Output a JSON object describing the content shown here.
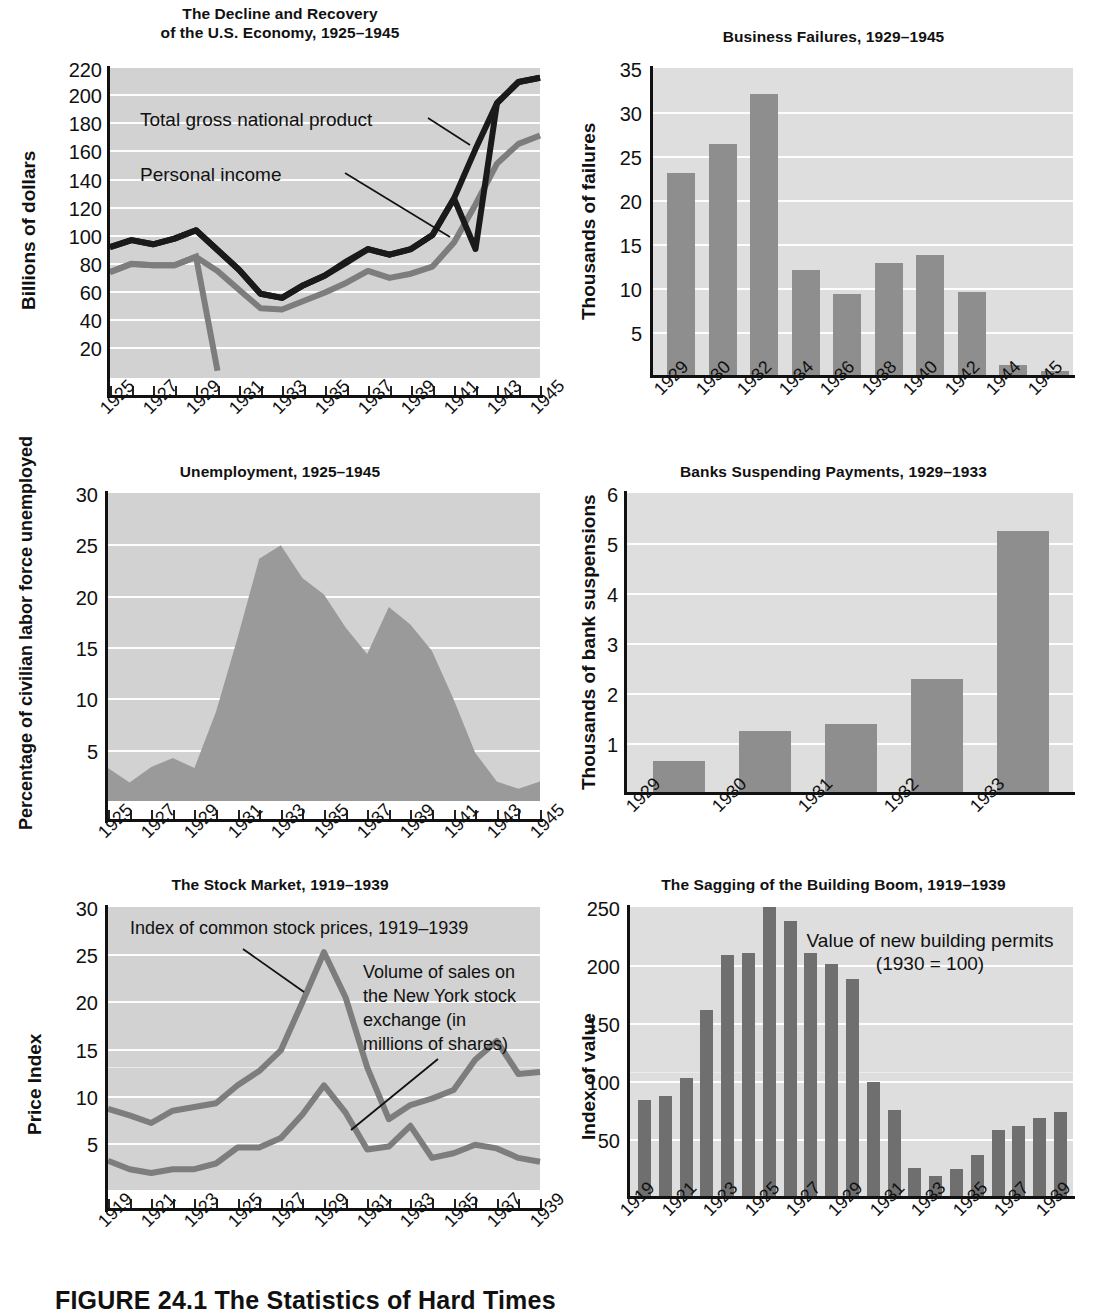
{
  "figure": {
    "caption": "FIGURE 24.1  The Statistics of Hard Times"
  },
  "charts": [
    {
      "id": "gnp",
      "title_line1": "The Decline and Recovery",
      "title_line2": "of the U.S. Economy, 1925–1945",
      "ylabel": "Billions of dollars",
      "yticks": [
        "220",
        "200",
        "180",
        "160",
        "140",
        "120",
        "100",
        "80",
        "60",
        "40",
        "20"
      ],
      "xticks": [
        "1925",
        "1927",
        "1929",
        "1931",
        "1933",
        "1935",
        "1937",
        "1939",
        "1941",
        "1943",
        "1945"
      ],
      "annotations": [
        "Total gross national product",
        "Personal income"
      ],
      "chart_data": {
        "type": "line",
        "title": "The Decline and Recovery of the U.S. Economy, 1925–1945",
        "xlabel": "",
        "ylabel": "Billions of dollars",
        "ylim": [
          0,
          220
        ],
        "grid": true,
        "legend": "inline-annotation",
        "x": [
          1925,
          1926,
          1927,
          1928,
          1929,
          1930,
          1931,
          1932,
          1933,
          1934,
          1935,
          1936,
          1937,
          1938,
          1939,
          1940,
          1941,
          1942,
          1943,
          1944,
          1945
        ],
        "series": [
          {
            "name": "Total gross national product",
            "color": "#1a1a1a",
            "values": [
              93,
              98,
              95,
              99,
              105,
              91,
              77,
              60,
              57,
              66,
              73,
              83,
              91,
              87,
              91,
              101,
              127,
              162,
              195,
              210,
              213
            ]
          },
          {
            "name": "Personal income",
            "color": "#7d7d7d",
            "values": [
              75,
              81,
              80,
              80,
              86,
              76,
              63,
              50,
              49,
              55,
              61,
              68,
              76,
              71,
              74,
              79,
              96,
              123,
              152,
              166,
              172
            ]
          }
        ]
      }
    },
    {
      "id": "business-failures",
      "title_line1": "Business Failures, 1929–1945",
      "title_line2": "",
      "ylabel": "Thousands of failures",
      "yticks": [
        "35",
        "30",
        "25",
        "20",
        "15",
        "10",
        "5"
      ],
      "xticks": [
        "1929",
        "1930",
        "1932",
        "1934",
        "1936",
        "1938",
        "1940",
        "1942",
        "1944",
        "1945"
      ],
      "annotations": [],
      "chart_data": {
        "type": "bar",
        "title": "Business Failures, 1929–1945",
        "xlabel": "",
        "ylabel": "Thousands of failures",
        "ylim": [
          0,
          35
        ],
        "grid": true,
        "categories": [
          "1929",
          "1930",
          "1932",
          "1934",
          "1936",
          "1938",
          "1940",
          "1942",
          "1944",
          "1945"
        ],
        "values": [
          23.1,
          26.4,
          32.0,
          12.0,
          9.3,
          12.8,
          13.8,
          9.5,
          1.2,
          0.6
        ]
      }
    },
    {
      "id": "unemployment",
      "title_line1": "Unemployment, 1925–1945",
      "title_line2": "",
      "ylabel": "Percentage of civilian labor force unemployed",
      "yticks": [
        "30",
        "25",
        "20",
        "15",
        "10",
        "5"
      ],
      "xticks": [
        "1925",
        "1927",
        "1929",
        "1931",
        "1933",
        "1935",
        "1937",
        "1939",
        "1941",
        "1943",
        "1945"
      ],
      "annotations": [],
      "chart_data": {
        "type": "area",
        "title": "Unemployment, 1925–1945",
        "xlabel": "",
        "ylabel": "Percentage of civilian labor force unemployed",
        "ylim": [
          0,
          30
        ],
        "grid": true,
        "x": [
          1925,
          1926,
          1927,
          1928,
          1929,
          1930,
          1931,
          1932,
          1933,
          1934,
          1935,
          1936,
          1937,
          1938,
          1939,
          1940,
          1941,
          1942,
          1943,
          1944,
          1945
        ],
        "values": [
          3.2,
          1.8,
          3.3,
          4.2,
          3.2,
          8.7,
          15.9,
          23.6,
          24.9,
          21.7,
          20.1,
          16.9,
          14.3,
          19.0,
          17.2,
          14.6,
          9.9,
          4.7,
          1.9,
          1.2,
          1.9
        ]
      }
    },
    {
      "id": "bank-suspensions",
      "title_line1": "Banks Suspending Payments, 1929–1933",
      "title_line2": "",
      "ylabel": "Thousands of bank suspensions",
      "yticks": [
        "6",
        "5",
        "4",
        "3",
        "2",
        "1"
      ],
      "xticks": [
        "1929",
        "1930",
        "1931",
        "1932",
        "1933"
      ],
      "annotations": [],
      "chart_data": {
        "type": "bar",
        "title": "Banks Suspending Payments, 1929–1933",
        "xlabel": "",
        "ylabel": "Thousands of bank suspensions",
        "ylim": [
          0,
          6
        ],
        "grid": true,
        "categories": [
          "1929",
          "1930",
          "1931",
          "1932",
          "1933"
        ],
        "values": [
          0.64,
          1.25,
          1.39,
          2.28,
          5.25
        ]
      }
    },
    {
      "id": "stock-market",
      "title_line1": "The Stock Market, 1919–1939",
      "title_line2": "",
      "ylabel": "Price Index",
      "yticks": [
        "30",
        "25",
        "20",
        "15",
        "10",
        "5"
      ],
      "xticks": [
        "1919",
        "1921",
        "1923",
        "1925",
        "1927",
        "1929",
        "1931",
        "1933",
        "1935",
        "1937",
        "1939"
      ],
      "annotations": [
        "Index of common stock prices, 1919–1939",
        "Volume of sales on the New York stock exchange (in millions of shares)"
      ],
      "chart_data": {
        "type": "line",
        "title": "The Stock Market, 1919–1939",
        "xlabel": "",
        "ylabel": "Price Index",
        "ylim": [
          0,
          30
        ],
        "grid": true,
        "x": [
          1919,
          1920,
          1921,
          1922,
          1923,
          1924,
          1925,
          1926,
          1927,
          1928,
          1929,
          1930,
          1931,
          1932,
          1933,
          1934,
          1935,
          1936,
          1937,
          1938,
          1939
        ],
        "series": [
          {
            "name": "Index of common stock prices, 1919–1939",
            "color": "#7d7d7d",
            "values": [
              8.6,
              7.9,
              7.1,
              8.4,
              8.8,
              9.2,
              11.1,
              12.6,
              14.8,
              19.9,
              25.2,
              20.4,
              13.0,
              7.5,
              9.0,
              9.7,
              10.6,
              13.8,
              15.8,
              15.8,
              12.3,
              12.5
            ]
          },
          {
            "name": "Volume of sales on the New York stock exchange (in millions of shares)",
            "color": "#7d7d7d",
            "values": [
              3.1,
              2.2,
              1.8,
              2.2,
              2.2,
              2.8,
              4.5,
              4.5,
              5.5,
              8.0,
              11.1,
              8.2,
              6.0,
              4.6,
              6.8,
              3.4,
              3.9,
              4.8,
              4.4,
              3.4,
              3.0
            ]
          }
        ]
      }
    },
    {
      "id": "building-boom",
      "title_line1": "The Sagging of the Building Boom, 1919–1939",
      "title_line2": "",
      "ylabel": "Index of value",
      "yticks": [
        "250",
        "200",
        "150",
        "100",
        "50"
      ],
      "xticks": [
        "1919",
        "1921",
        "1923",
        "1925",
        "1927",
        "1929",
        "1931",
        "1933",
        "1935",
        "1937",
        "1939"
      ],
      "annotations": [
        "Value of new building permits",
        "(1930 = 100)"
      ],
      "chart_data": {
        "type": "bar",
        "title": "The Sagging of the Building Boom, 1919–1939",
        "xlabel": "",
        "ylabel": "Index of value",
        "ylim": [
          0,
          250
        ],
        "grid": true,
        "categories": [
          "1919",
          "1920",
          "1921",
          "1922",
          "1923",
          "1924",
          "1925",
          "1926",
          "1927",
          "1928",
          "1929",
          "1930",
          "1931",
          "1932",
          "1933",
          "1934",
          "1935",
          "1936",
          "1937",
          "1938",
          "1939"
        ],
        "values": [
          84,
          87,
          103,
          161,
          209,
          210,
          250,
          238,
          210,
          201,
          188,
          99,
          75,
          25,
          18,
          24,
          36,
          58,
          61,
          68,
          73
        ]
      }
    }
  ]
}
